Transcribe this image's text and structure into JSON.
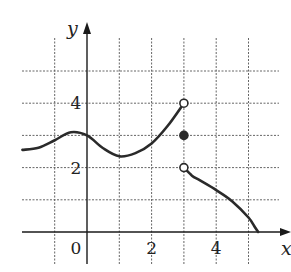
{
  "chart_data": {
    "type": "line",
    "title": "",
    "xlabel": "x",
    "ylabel": "y",
    "xlim": [
      -2,
      6.3
    ],
    "ylim": [
      -1,
      6
    ],
    "grid": true,
    "grid_x": [
      -2,
      -1,
      1,
      2,
      3,
      4,
      5
    ],
    "grid_y": [
      1,
      2,
      3,
      4,
      5
    ],
    "x_tick_labels": [
      {
        "value": 0,
        "label": "0"
      },
      {
        "value": 2,
        "label": "2"
      },
      {
        "value": 4,
        "label": "4"
      }
    ],
    "y_tick_labels": [
      {
        "value": 2,
        "label": "2"
      },
      {
        "value": 4,
        "label": "4"
      }
    ],
    "series": [
      {
        "name": "left branch (x < 3)",
        "x": [
          -2,
          -1.5,
          -1,
          -0.5,
          0,
          0.5,
          1,
          1.5,
          2,
          2.5,
          3
        ],
        "y": [
          2.55,
          2.62,
          2.85,
          3.1,
          3.0,
          2.6,
          2.35,
          2.45,
          2.75,
          3.3,
          4.0
        ]
      },
      {
        "name": "right branch (x > 3)",
        "x": [
          3,
          3.25,
          3.5,
          4,
          4.5,
          5,
          5.2,
          5.3
        ],
        "y": [
          2.0,
          1.75,
          1.6,
          1.3,
          0.95,
          0.45,
          0.15,
          0.0
        ]
      }
    ],
    "points": [
      {
        "x": 3,
        "y": 4,
        "style": "open",
        "note": "limit from left, excluded"
      },
      {
        "x": 3,
        "y": 3,
        "style": "filled",
        "note": "f(3) = 3"
      },
      {
        "x": 3,
        "y": 2,
        "style": "open",
        "note": "limit from right, excluded"
      }
    ],
    "colors": {
      "curve": "#2a2a2a",
      "grid": "#555555",
      "axis": "#1a1a1a",
      "background": "#ffffff"
    }
  }
}
